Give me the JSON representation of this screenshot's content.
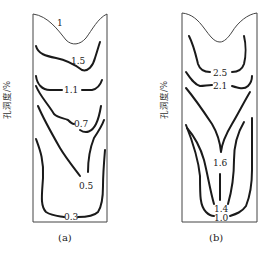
{
  "figure": {
    "y_axis_label": "孔洞度/%",
    "panels": [
      {
        "id": "a",
        "caption": "(a)",
        "contour_labels": [
          "1",
          "1.5",
          "1.1",
          "0.7",
          "0.5",
          "0.3"
        ]
      },
      {
        "id": "b",
        "caption": "(b)",
        "contour_labels": [
          "2.5",
          "2.1",
          "1.6",
          "1.4",
          "1.0"
        ]
      }
    ]
  }
}
